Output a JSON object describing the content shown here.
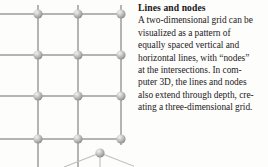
{
  "figure": {
    "name": "two-dimensional-grid-of-lines-and-nodes",
    "background_color": "#fdfdfb",
    "line_color": "#b2b2b2",
    "node_color": "#a8a8a8",
    "node_highlight_color": "#efefef",
    "grid": {
      "columns_x": [
        38,
        78,
        121
      ],
      "rows_y": [
        14,
        55,
        96,
        139
      ],
      "node_radius": 4.6,
      "left_bleed_x": 0,
      "description": "Equally spaced vertical and horizontal lines with spherical nodes at the intersections; lines run off the left edge of the crop."
    },
    "depth_node": {
      "x": 100,
      "y": 153,
      "radius": 4.6,
      "description": "Node extending through depth below the grid with three radiating perspective lines."
    }
  },
  "caption": {
    "title": "Lines and nodes",
    "body_lines": [
      "A two-dimensional grid can be",
      "visualized as a pattern of",
      "equally spaced vertical and",
      "horizontal lines, with “nodes”",
      "at the intersections. In com-",
      "puter 3D, the lines and nodes",
      "also extend through depth, cre-",
      "ating a three-dimensional grid."
    ]
  }
}
